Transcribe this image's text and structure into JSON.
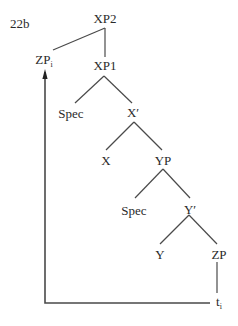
{
  "figure": {
    "label": "22b",
    "line_color": "#4a4a4a",
    "text_color": "#2a2a2a"
  },
  "nodes": [
    {
      "id": "xp2",
      "text": "XP2",
      "sub": "",
      "x": 105,
      "y": 12
    },
    {
      "id": "zp-i",
      "text": "ZP",
      "sub": "i",
      "x": 44,
      "y": 53
    },
    {
      "id": "xp1",
      "text": "XP1",
      "sub": "",
      "x": 105,
      "y": 59
    },
    {
      "id": "spec1",
      "text": "Spec",
      "sub": "",
      "x": 71,
      "y": 107
    },
    {
      "id": "xbar",
      "text": "X′",
      "sub": "",
      "x": 133,
      "y": 106
    },
    {
      "id": "x",
      "text": "X",
      "sub": "",
      "x": 106,
      "y": 154
    },
    {
      "id": "yp",
      "text": "YP",
      "sub": "",
      "x": 163,
      "y": 154
    },
    {
      "id": "spec2",
      "text": "Spec",
      "sub": "",
      "x": 134,
      "y": 204
    },
    {
      "id": "ybar",
      "text": "Y′",
      "sub": "",
      "x": 190,
      "y": 203
    },
    {
      "id": "y",
      "text": "Y",
      "sub": "",
      "x": 160,
      "y": 248
    },
    {
      "id": "zp",
      "text": "ZP",
      "sub": "",
      "x": 219,
      "y": 248
    },
    {
      "id": "t-i",
      "text": "t",
      "sub": "i",
      "x": 219,
      "y": 295
    }
  ],
  "edges": [
    {
      "from": "xp2",
      "to": "zp-i",
      "x1": 105,
      "y1": 28,
      "x2": 53,
      "y2": 50
    },
    {
      "from": "xp2",
      "to": "xp1",
      "x1": 105,
      "y1": 28,
      "x2": 105,
      "y2": 57
    },
    {
      "from": "xp1",
      "to": "spec1",
      "x1": 104,
      "y1": 76,
      "x2": 75,
      "y2": 103
    },
    {
      "from": "xp1",
      "to": "xbar",
      "x1": 104,
      "y1": 76,
      "x2": 132,
      "y2": 103
    },
    {
      "from": "xbar",
      "to": "x",
      "x1": 134,
      "y1": 122,
      "x2": 106,
      "y2": 150
    },
    {
      "from": "xbar",
      "to": "yp",
      "x1": 134,
      "y1": 122,
      "x2": 162,
      "y2": 150
    },
    {
      "from": "yp",
      "to": "spec2",
      "x1": 163,
      "y1": 169,
      "x2": 135,
      "y2": 198
    },
    {
      "from": "yp",
      "to": "ybar",
      "x1": 163,
      "y1": 169,
      "x2": 190,
      "y2": 198
    },
    {
      "from": "ybar",
      "to": "y",
      "x1": 189,
      "y1": 215,
      "x2": 160,
      "y2": 244
    },
    {
      "from": "ybar",
      "to": "zp",
      "x1": 189,
      "y1": 215,
      "x2": 217,
      "y2": 244
    },
    {
      "from": "zp",
      "to": "t-i",
      "x1": 217,
      "y1": 262,
      "x2": 217,
      "y2": 293
    }
  ],
  "movement_arrow": {
    "from": "t-i",
    "to": "zp-i",
    "points": [
      [
        210,
        303
      ],
      [
        45,
        303
      ],
      [
        45,
        72
      ]
    ],
    "arrow_tip": [
      45,
      69
    ]
  }
}
